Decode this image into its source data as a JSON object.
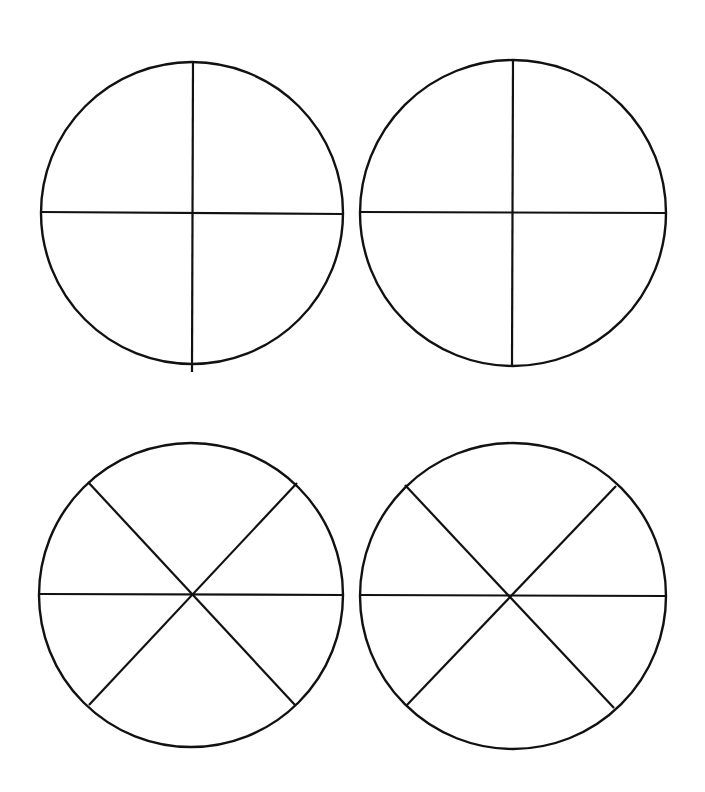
{
  "canvas": {
    "width": 705,
    "height": 792,
    "background": "#ffffff",
    "stroke_color": "#111111"
  },
  "circles": [
    {
      "id": "circle-1",
      "label": "quarters",
      "sections": 4,
      "cx": 192,
      "cy": 213,
      "r": 151,
      "lines": [
        {
          "x1": 41,
          "y1": 212,
          "x2": 343,
          "y2": 214
        },
        {
          "x1": 193,
          "y1": 62,
          "x2": 192,
          "y2": 372
        }
      ]
    },
    {
      "id": "circle-2",
      "label": "quarters",
      "sections": 4,
      "cx": 513,
      "cy": 213,
      "r": 153,
      "lines": [
        {
          "x1": 361,
          "y1": 212,
          "x2": 666,
          "y2": 213
        },
        {
          "x1": 513,
          "y1": 60,
          "x2": 512,
          "y2": 367
        }
      ]
    },
    {
      "id": "circle-3",
      "label": "sixths",
      "sections": 6,
      "cx": 191,
      "cy": 595,
      "r": 152,
      "lines": [
        {
          "x1": 40,
          "y1": 594,
          "x2": 342,
          "y2": 595
        },
        {
          "x1": 88,
          "y1": 482,
          "x2": 295,
          "y2": 705
        },
        {
          "x1": 297,
          "y1": 483,
          "x2": 89,
          "y2": 705
        }
      ]
    },
    {
      "id": "circle-4",
      "label": "sixths",
      "sections": 6,
      "cx": 513,
      "cy": 596,
      "r": 153,
      "lines": [
        {
          "x1": 361,
          "y1": 595,
          "x2": 666,
          "y2": 596
        },
        {
          "x1": 405,
          "y1": 485,
          "x2": 614,
          "y2": 708
        },
        {
          "x1": 616,
          "y1": 486,
          "x2": 406,
          "y2": 706
        }
      ]
    }
  ]
}
